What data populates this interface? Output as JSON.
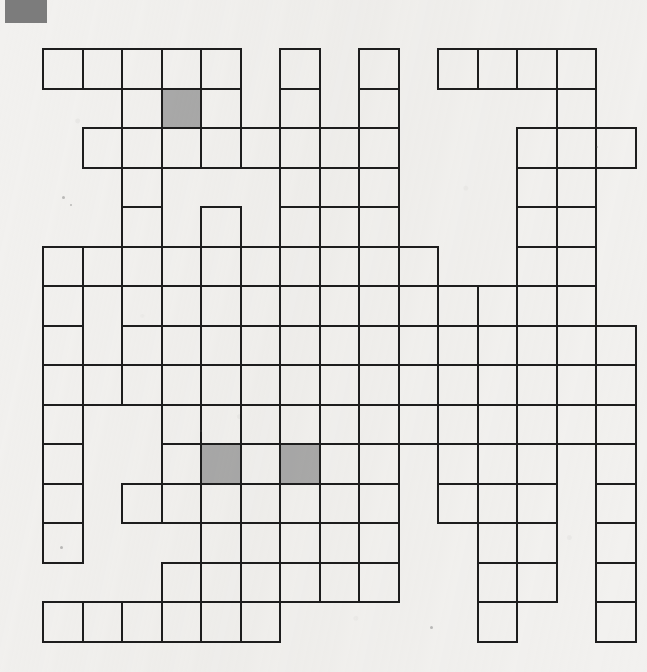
{
  "page": {
    "width": 647,
    "height": 672,
    "background_color": "#f2f1ef",
    "kind": "scanned-crossword-puzzle-grid"
  },
  "corner_mark": {
    "name": "printer-registration-mark",
    "color": "#7c7c7c",
    "x": 5,
    "y": 0,
    "width": 42,
    "height": 23
  },
  "grid": {
    "origin_x": 42,
    "origin_y": 48,
    "cell_size": 39.5,
    "columns": 15,
    "rows": 15,
    "line_color": "#1d1d1d",
    "line_width": 2.4,
    "empty_cell_color": "transparent",
    "shaded_cell_color": "#a9a9a9",
    "shaded_cells": [
      {
        "row": 1,
        "col": 3
      },
      {
        "row": 10,
        "col": 4
      },
      {
        "row": 10,
        "col": 6
      }
    ],
    "cell_map": [
      [
        1,
        1,
        1,
        1,
        1,
        0,
        1,
        0,
        1,
        0,
        1,
        1,
        1,
        1,
        0
      ],
      [
        0,
        0,
        1,
        1,
        1,
        0,
        1,
        0,
        1,
        0,
        0,
        0,
        0,
        1,
        0
      ],
      [
        0,
        1,
        1,
        1,
        1,
        1,
        1,
        1,
        1,
        0,
        0,
        0,
        1,
        1,
        1
      ],
      [
        0,
        0,
        1,
        0,
        0,
        0,
        1,
        1,
        1,
        0,
        0,
        0,
        1,
        1,
        0
      ],
      [
        0,
        0,
        1,
        0,
        1,
        0,
        1,
        0,
        1,
        0,
        0,
        0,
        1,
        1,
        0
      ],
      [
        1,
        1,
        1,
        1,
        1,
        1,
        1,
        1,
        1,
        1,
        0,
        0,
        1,
        1,
        0
      ],
      [
        1,
        0,
        1,
        1,
        1,
        1,
        1,
        1,
        1,
        1,
        1,
        1,
        1,
        1,
        0
      ],
      [
        1,
        0,
        1,
        0,
        1,
        0,
        1,
        0,
        1,
        1,
        1,
        1,
        1,
        1,
        1
      ],
      [
        1,
        1,
        1,
        1,
        1,
        1,
        1,
        1,
        1,
        1,
        1,
        1,
        1,
        1,
        1
      ],
      [
        1,
        0,
        0,
        1,
        1,
        1,
        1,
        1,
        1,
        1,
        1,
        1,
        1,
        1,
        1
      ],
      [
        1,
        0,
        0,
        1,
        1,
        1,
        1,
        1,
        1,
        0,
        1,
        1,
        1,
        0,
        1
      ],
      [
        1,
        0,
        1,
        1,
        1,
        1,
        1,
        1,
        1,
        0,
        1,
        1,
        1,
        0,
        1
      ],
      [
        1,
        0,
        0,
        0,
        1,
        1,
        1,
        0,
        1,
        0,
        0,
        1,
        1,
        0,
        1
      ],
      [
        0,
        0,
        0,
        1,
        1,
        1,
        1,
        1,
        1,
        0,
        0,
        1,
        1,
        0,
        1
      ],
      [
        1,
        1,
        1,
        1,
        1,
        1,
        0,
        0,
        0,
        0,
        0,
        1,
        0,
        0,
        1
      ]
    ]
  },
  "specks": [
    {
      "x": 62,
      "y": 196,
      "size": 3
    },
    {
      "x": 70,
      "y": 204,
      "size": 2
    },
    {
      "x": 60,
      "y": 546,
      "size": 3
    },
    {
      "x": 430,
      "y": 626,
      "size": 3
    },
    {
      "x": 200,
      "y": 430,
      "size": 2
    },
    {
      "x": 596,
      "y": 146,
      "size": 2
    }
  ]
}
